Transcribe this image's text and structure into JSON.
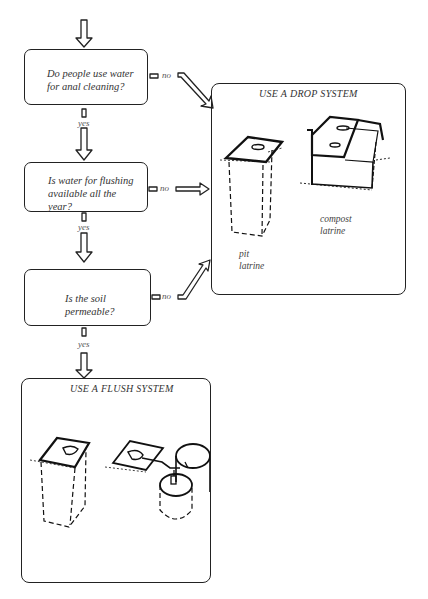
{
  "flowchart": {
    "questions": [
      {
        "text_line1": "Do people use water",
        "text_line2": "for anal cleaning?",
        "text_line3": ""
      },
      {
        "text_line1": "Is water for flushing",
        "text_line2": "available all the",
        "text_line3": "year?"
      },
      {
        "text_line1": "Is the soil",
        "text_line2": "permeable?",
        "text_line3": ""
      }
    ],
    "branch_labels": {
      "no": "no",
      "yes": "yes"
    },
    "drop_panel": {
      "title": "USE A DROP SYSTEM",
      "captions": [
        {
          "line1": "pit",
          "line2": "latrine"
        },
        {
          "line1": "compost",
          "line2": "latrine"
        }
      ]
    },
    "flush_panel": {
      "title": "USE A FLUSH SYSTEM"
    }
  }
}
